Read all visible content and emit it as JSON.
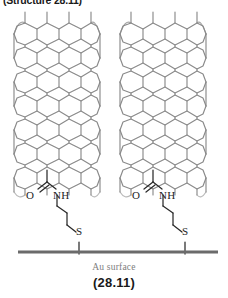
{
  "figure": {
    "top_caption": "(Structure 28.11)",
    "au_surface_label": "Au surface",
    "figure_number": "(28.11)",
    "background_color": "#ffffff",
    "lattice_color": "#8a8a8a",
    "bond_color": "#2a2a2a",
    "surface_color": "#6b6b6b",
    "label_color": "#1d1d1d",
    "caption_color": "#7d7d7d"
  },
  "structures": [
    {
      "id": "left",
      "nanotube": {
        "name": "carbon-nanotube",
        "x": 14,
        "y": 12,
        "width": 86,
        "height": 172,
        "chirality": "armchair",
        "columns": 5,
        "rows": 7
      },
      "linker": {
        "carbonyl_oxygen": "O",
        "amide_nitrogen": "NH",
        "thiol_sulfur": "S",
        "chain": "propyl"
      },
      "labels": {
        "o": {
          "text": "O",
          "x": 27,
          "y": 196
        },
        "nh": {
          "text": "NH",
          "x": 54,
          "y": 196
        },
        "s": {
          "text": "S",
          "x": 77,
          "y": 232
        }
      }
    },
    {
      "id": "right",
      "nanotube": {
        "name": "carbon-nanotube",
        "x": 120,
        "y": 12,
        "width": 86,
        "height": 172,
        "chirality": "armchair",
        "columns": 5,
        "rows": 7
      },
      "linker": {
        "carbonyl_oxygen": "O",
        "amide_nitrogen": "NH",
        "thiol_sulfur": "S",
        "chain": "propyl"
      },
      "labels": {
        "o": {
          "text": "O",
          "x": 133,
          "y": 196
        },
        "nh": {
          "text": "NH",
          "x": 160,
          "y": 196
        },
        "s": {
          "text": "S",
          "x": 183,
          "y": 232
        }
      }
    }
  ],
  "surface": {
    "label": "Au surface",
    "x1": 18,
    "x2": 218,
    "y": 252,
    "thickness": 3
  }
}
